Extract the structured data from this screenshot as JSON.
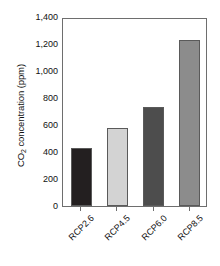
{
  "chart_data": {
    "type": "bar",
    "title": "",
    "subtitle": "",
    "xlabel": "",
    "ylabel": "CO2 concentration (ppm)",
    "ylabel_parts": {
      "pre": "CO",
      "sub": "2",
      "post": " concentration (ppm)"
    },
    "categories": [
      "RCP2.6",
      "RCP4.5",
      "RCP6.0",
      "RCP8.5"
    ],
    "values": [
      430,
      580,
      730,
      1230
    ],
    "bar_colors": [
      "#231f20",
      "#d3d3d3",
      "#4d4d4d",
      "#8c8c8c"
    ],
    "bar_edge_color": "#5a5a5a",
    "ylim": [
      0,
      1400
    ],
    "ytick_values": [
      0,
      200,
      400,
      600,
      800,
      1000,
      1200,
      1400
    ],
    "ytick_labels": [
      "0",
      "200",
      "400",
      "600",
      "800",
      "1,000",
      "1,200",
      "1,400"
    ],
    "grid": false,
    "legend": false,
    "legend_position": "none",
    "frame_color": "#6e6e6e",
    "background_color": "#ffffff",
    "xtick_label_rotation": "-45"
  }
}
